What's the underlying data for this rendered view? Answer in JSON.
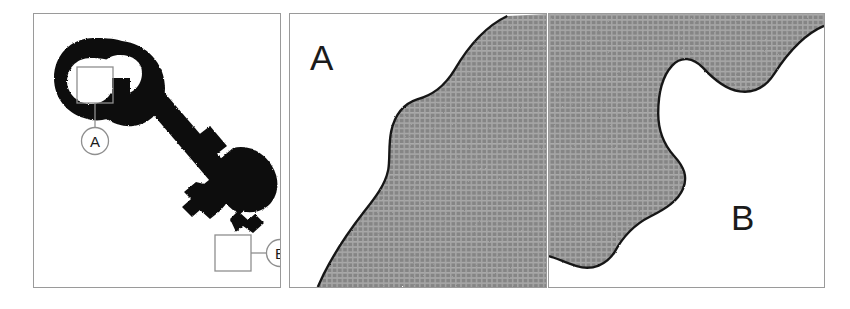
{
  "figure": {
    "caption_letters": [
      "A",
      "B"
    ],
    "panel_count": 3,
    "background_color": "#ffffff",
    "border_color": "#9a9a9a"
  },
  "panels": [
    {
      "id": "key-overview",
      "role": "overview",
      "subject": "antique-skeleton-key-silhouette",
      "silhouette_color": "#111111",
      "callouts": [
        {
          "label": "A",
          "marker_shape": "circle",
          "box_shape": "square",
          "region": "key-bow-inner-edge"
        },
        {
          "label": "B",
          "marker_shape": "circle",
          "box_shape": "square",
          "region": "key-bit-notch"
        }
      ]
    },
    {
      "id": "detail-a",
      "role": "magnified-detail",
      "label": "A",
      "label_position": "top-left",
      "regions": [
        {
          "name": "background-region",
          "fill": "white"
        },
        {
          "name": "material-region",
          "fill": "cross-hatch-gray",
          "color": "#8a8a8a"
        }
      ],
      "boundary": "single wavy vertical edge, material on right"
    },
    {
      "id": "detail-b",
      "role": "magnified-detail",
      "label": "B",
      "label_position": "center-right",
      "regions": [
        {
          "name": "material-region",
          "fill": "cross-hatch-gray",
          "color": "#8a8a8a"
        },
        {
          "name": "background-region",
          "fill": "white"
        }
      ],
      "boundary": "lobed concave edge, material on left"
    }
  ],
  "labels": {
    "letter_a": "A",
    "letter_b": "B",
    "callout_a": "A",
    "callout_b": "B"
  },
  "colors": {
    "hatch_gray": "#8a8a8a",
    "hatch_line": "#a9a9a9",
    "outline_black": "#111111",
    "frame_gray": "#9a9a9a"
  },
  "alt_text": "Three-panel figure: a black key silhouette with callouts A and B, and two magnified cross-hatched surface details labelled A and B."
}
